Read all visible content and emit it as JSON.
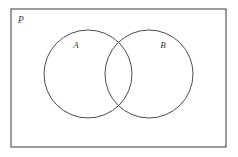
{
  "figure": {
    "type": "venn-diagram",
    "width": 238,
    "height": 157,
    "background_color": "#ffffff",
    "stroke_color": "#4a4a4a",
    "label_color": "#3a3a3a"
  },
  "universe": {
    "label": "P",
    "label_x": 18,
    "label_y": 23,
    "rect": {
      "x": 11,
      "y": 9,
      "width": 215,
      "height": 138
    },
    "fill": "#ffffff",
    "stroke": "#4a4a4a"
  },
  "sets": [
    {
      "label": "A",
      "cx": 88,
      "cy": 74,
      "r": 44,
      "label_x": 76,
      "label_y": 48,
      "fill": "none",
      "stroke": "#4a4a4a"
    },
    {
      "label": "B",
      "cx": 149,
      "cy": 74,
      "r": 44,
      "label_x": 163,
      "label_y": 48,
      "fill": "none",
      "stroke": "#4a4a4a"
    }
  ],
  "intersection": {
    "top_point": {
      "x": 118,
      "y": 43
    },
    "bottom_point": {
      "x": 118,
      "y": 105
    },
    "label": ""
  }
}
